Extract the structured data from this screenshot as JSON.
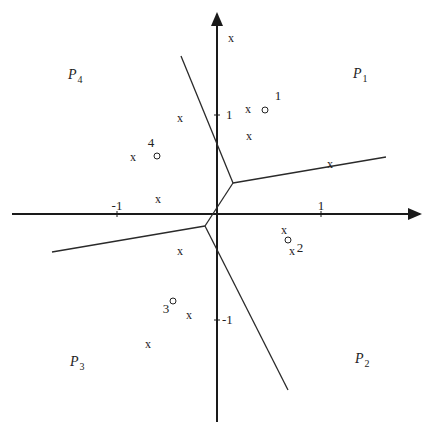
{
  "axes": {
    "x_ticks": [
      {
        "label": "-1",
        "x": 117,
        "y": 214,
        "lx": 117,
        "ly": 210
      },
      {
        "label": "1",
        "x": 321,
        "y": 214,
        "lx": 321,
        "ly": 210
      }
    ],
    "y_ticks": [
      {
        "label": "1",
        "x": 217,
        "y": 115,
        "lx": 226,
        "ly": 119
      },
      {
        "label": "-1",
        "x": 217,
        "y": 320,
        "lx": 222,
        "ly": 324
      }
    ]
  },
  "regions": [
    {
      "name": "P",
      "sub": "4",
      "x": 68,
      "y": 79
    },
    {
      "name": "P",
      "sub": "1",
      "x": 353,
      "y": 78
    },
    {
      "name": "P",
      "sub": "3",
      "x": 70,
      "y": 366
    },
    {
      "name": "P",
      "sub": "2",
      "x": 355,
      "y": 363
    }
  ],
  "centers": [
    {
      "label": "1",
      "x": 265,
      "y": 110,
      "lx": 278,
      "ly": 100
    },
    {
      "label": "2",
      "x": 288,
      "y": 240,
      "lx": 300,
      "ly": 252
    },
    {
      "label": "3",
      "x": 173,
      "y": 301,
      "lx": 166,
      "ly": 313
    },
    {
      "label": "4",
      "x": 157,
      "y": 156,
      "lx": 151,
      "ly": 147
    }
  ],
  "points": {
    "marker": "x",
    "list": [
      {
        "x": 231,
        "y": 38
      },
      {
        "x": 180,
        "y": 118
      },
      {
        "x": 248,
        "y": 109
      },
      {
        "x": 249,
        "y": 136
      },
      {
        "x": 133,
        "y": 157
      },
      {
        "x": 330,
        "y": 164
      },
      {
        "x": 158,
        "y": 199
      },
      {
        "x": 284,
        "y": 230
      },
      {
        "x": 292,
        "y": 251
      },
      {
        "x": 180,
        "y": 251
      },
      {
        "x": 189,
        "y": 315
      },
      {
        "x": 148,
        "y": 344
      }
    ]
  },
  "edges": [
    {
      "x1": 181,
      "y1": 56,
      "x2": 233,
      "y2": 183
    },
    {
      "x1": 233,
      "y1": 183,
      "x2": 386,
      "y2": 157
    },
    {
      "x1": 233,
      "y1": 183,
      "x2": 205,
      "y2": 226
    },
    {
      "x1": 205,
      "y1": 226,
      "x2": 52,
      "y2": 252
    },
    {
      "x1": 205,
      "y1": 226,
      "x2": 288,
      "y2": 390
    }
  ]
}
